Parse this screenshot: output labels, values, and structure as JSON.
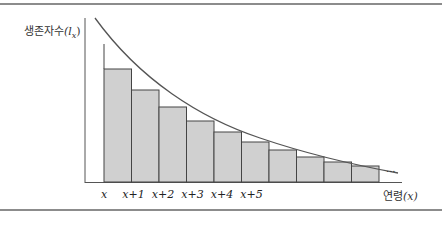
{
  "chart_data": {
    "type": "bar",
    "title": "",
    "ylabel": "생존자수(lx)",
    "ylabel_text": "생존자수",
    "ylabel_symbol": "(l",
    "ylabel_sub": "x",
    "ylabel_close": ")",
    "xlabel": "연령(x)",
    "xlabel_text": "연령",
    "xlabel_symbol": "(x)",
    "categories": [
      "x",
      "x+1",
      "x+2",
      "x+3",
      "x+4",
      "x+5",
      "",
      "",
      "",
      ""
    ],
    "tick_labels": [
      "x",
      "x+1",
      "x+2",
      "x+3",
      "x+4",
      "x+5"
    ],
    "values": [
      113,
      92,
      75,
      61,
      50,
      40,
      32,
      25,
      20,
      16
    ],
    "curve": "decreasing exponential survival curve l(x) over bars",
    "continuation": "...",
    "grid": false,
    "colors": {
      "bar_fill": "#d0d0d0",
      "bar_stroke": "#444444",
      "curve": "#555555",
      "axis": "#555555",
      "frame": "#8c8c8c"
    }
  }
}
